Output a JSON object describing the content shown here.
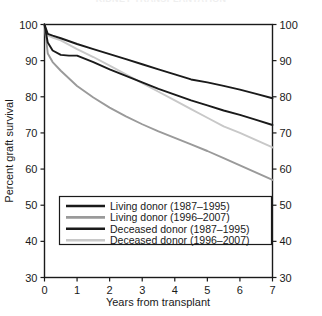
{
  "chart_data": {
    "type": "line",
    "title": "KIDNEY TRANSPLANTATION",
    "xlabel": "Years from transplant",
    "ylabel": "Percent graft survival",
    "xlim": [
      0,
      7
    ],
    "ylim": [
      30,
      100
    ],
    "xticks": [
      0,
      1,
      2,
      3,
      4,
      5,
      6,
      7
    ],
    "xticklabels": [
      "0",
      "1",
      "2",
      "3",
      "4",
      "5",
      "6",
      "7"
    ],
    "yticks": [
      30,
      40,
      50,
      60,
      70,
      80,
      90,
      100
    ],
    "yticklabels": [
      "30",
      "40",
      "50",
      "60",
      "70",
      "80",
      "90",
      "100"
    ],
    "right_axis": true,
    "right_yticklabels": [
      "30",
      "40",
      "50",
      "60",
      "70",
      "80",
      "90",
      "100"
    ],
    "grid": false,
    "legend_position": "lower center",
    "series": [
      {
        "name": "Living donor (1987–1995)",
        "color": "#1a1a1a",
        "x": [
          0,
          0.1,
          0.25,
          0.5,
          1,
          1.5,
          2,
          2.5,
          3,
          3.5,
          4,
          4.5,
          5,
          5.5,
          6,
          6.5,
          7
        ],
        "values": [
          100,
          97.4,
          96.9,
          96.2,
          94.6,
          93.2,
          91.8,
          90.4,
          89.0,
          87.6,
          86.2,
          84.8,
          84.0,
          83.0,
          82.0,
          80.8,
          79.6
        ]
      },
      {
        "name": "Living donor (1996–2007)",
        "color": "#9a9a9a",
        "x": [
          0,
          0.1,
          0.25,
          0.5,
          1,
          1.5,
          2,
          2.5,
          3,
          3.5,
          4,
          4.5,
          5,
          5.5,
          6,
          6.5,
          7
        ],
        "values": [
          100,
          92.0,
          89.6,
          87.2,
          83.0,
          79.8,
          77.0,
          74.6,
          72.4,
          70.4,
          68.6,
          66.8,
          65.0,
          63.0,
          61.0,
          59.0,
          57.0
        ]
      },
      {
        "name": "Deceased donor (1987–1995)",
        "color": "#1a1a1a",
        "x": [
          0,
          0.1,
          0.25,
          0.5,
          0.75,
          1,
          1.5,
          2,
          2.5,
          3,
          3.5,
          4,
          4.5,
          5,
          5.5,
          6,
          6.5,
          7
        ],
        "values": [
          100,
          95.0,
          92.8,
          91.6,
          91.4,
          91.4,
          89.6,
          87.6,
          85.8,
          84.0,
          82.2,
          80.6,
          79.0,
          77.6,
          76.2,
          75.0,
          73.6,
          72.2
        ]
      },
      {
        "name": "Deceased donor (1996–2007)",
        "color": "#c8c8c8",
        "x": [
          0,
          0.1,
          0.25,
          0.5,
          1,
          1.5,
          2,
          2.5,
          3,
          3.5,
          4,
          4.5,
          5,
          5.5,
          6,
          6.5,
          7
        ],
        "values": [
          100,
          97.0,
          96.4,
          95.6,
          93.2,
          91.0,
          88.6,
          86.2,
          83.8,
          81.4,
          79.0,
          76.6,
          74.2,
          71.8,
          70.0,
          68.0,
          66.0
        ]
      }
    ]
  },
  "legend": {
    "entries": [
      {
        "label": "Living donor (1987–1995)"
      },
      {
        "label": "Living donor (1996–2007)"
      },
      {
        "label": "Deceased donor (1987–1995)"
      },
      {
        "label": "Deceased donor (1996–2007)"
      }
    ]
  },
  "colors": {
    "axis": "#1a1a1a",
    "background": "#ffffff",
    "dark_line": "#1a1a1a",
    "mid_gray_line": "#9a9a9a",
    "light_gray_line": "#c8c8c8"
  }
}
